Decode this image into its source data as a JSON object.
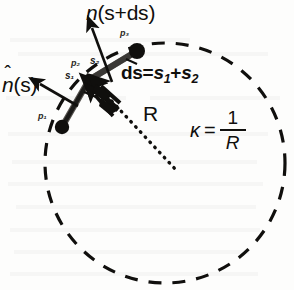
{
  "figure": {
    "background_color": "#fdfdfc",
    "ink_color": "#100f0d"
  },
  "labels": {
    "normal_at_s_plus_ds": {
      "symbol": "n",
      "hat": "ˆ",
      "arg": "(s+ds)"
    },
    "normal_at_s": {
      "symbol": "n",
      "hat": "ˆ",
      "arg": "(s)"
    },
    "arc_length_equation": {
      "lhs": "ds",
      "eq": "=",
      "term1": "s",
      "term1_sub": "1",
      "plus": "+",
      "term2": "s",
      "term2_sub": "2"
    },
    "radius_label": "R",
    "curvature_equation": {
      "kappa": "κ",
      "eq": "=",
      "numerator": "1",
      "denominator": "R"
    },
    "points": [
      {
        "name": "p1",
        "text": "p₁"
      },
      {
        "name": "p2",
        "text": "p₂"
      },
      {
        "name": "p3",
        "text": "p₃"
      }
    ],
    "segments": [
      {
        "name": "s1",
        "text": "s₁"
      },
      {
        "name": "s2",
        "text": "s₂"
      }
    ]
  },
  "geometry": {
    "circle": {
      "cx": 165,
      "cy": 163,
      "r": 120,
      "style": "dashed",
      "stroke_width": 3
    },
    "radius_line": {
      "x1": 107,
      "y1": 96,
      "x2": 176,
      "y2": 170,
      "style": "dotted"
    },
    "curve_points": [
      {
        "name": "p1",
        "x": 62,
        "y": 127,
        "dot_r": 7
      },
      {
        "name": "p2",
        "x": 89,
        "y": 80,
        "dot_r": 6
      },
      {
        "name": "p3",
        "x": 137,
        "y": 51,
        "dot_r": 8
      }
    ],
    "normal_vectors": [
      {
        "name": "n-at-s",
        "x1": 75,
        "y1": 103,
        "x2": 36,
        "y2": 81
      },
      {
        "name": "n-at-s-plus-ds",
        "x1": 110,
        "y1": 80,
        "x2": 90,
        "y2": 25
      }
    ],
    "delta_n_arrow": {
      "x1": 112,
      "y1": 107,
      "x2": 90,
      "y2": 88
    }
  }
}
